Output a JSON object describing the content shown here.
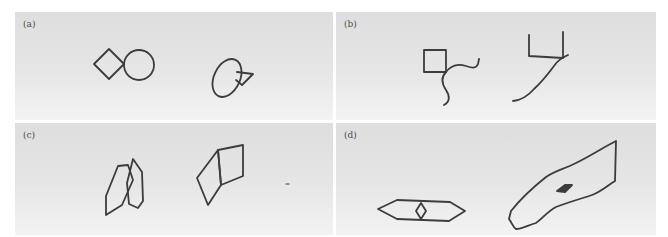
{
  "figure": {
    "panels": [
      {
        "id": "a",
        "label": "(a)",
        "left_figure": "diamond-touching-circle",
        "right_figure": "tilted-ellipse-with-small-diamond"
      },
      {
        "id": "b",
        "label": "(b)",
        "left_figure": "square-with-wavy-curve",
        "right_figure": "u-shape-with-diagonal-line"
      },
      {
        "id": "c",
        "label": "(c)",
        "left_figure": "two-overlapping-hexagons",
        "right_figure": "two-joined-quadrilaterals"
      },
      {
        "id": "d",
        "label": "(d)",
        "left_figure": "elongated-hexagon-with-center-diamond",
        "right_figure": "long-irregular-polygon-with-filled-diamond"
      }
    ]
  },
  "colors": {
    "stroke": "#3c3c3c",
    "panel_top": "#dedede",
    "panel_bottom": "#f3f3f3",
    "label": "#4a4a4a"
  }
}
